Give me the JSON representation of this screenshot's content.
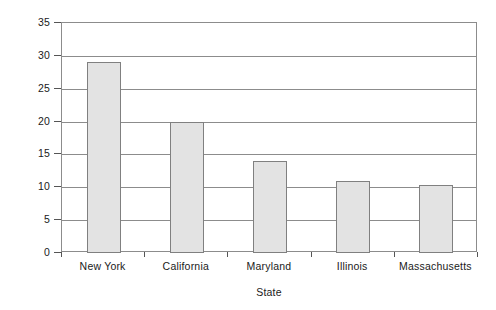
{
  "chart_data": {
    "type": "bar",
    "title": "",
    "xlabel": "State",
    "ylabel": "Number of programs",
    "categories": [
      "New York",
      "California",
      "Maryland",
      "Illinois",
      "Massachusetts"
    ],
    "values": [
      29,
      20,
      14,
      11,
      10.3
    ],
    "ylim": [
      0,
      35
    ],
    "ytick_labels": [
      "0",
      "5",
      "10",
      "15",
      "20",
      "25",
      "30",
      "35"
    ],
    "ytick_values": [
      0,
      5,
      10,
      15,
      20,
      25,
      30,
      35
    ],
    "grid": "horizontal",
    "legend": "none",
    "bar_fill_color": "#e3e3e3",
    "bar_border_color": "#808080",
    "axis_color": "#8c8c8c"
  }
}
